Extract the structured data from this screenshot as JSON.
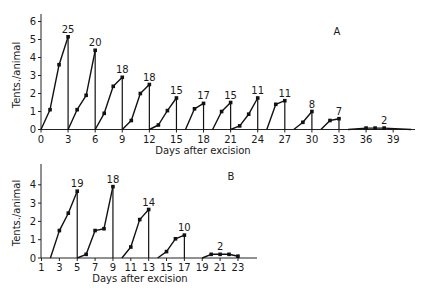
{
  "chart_data": [
    {
      "panel": "A",
      "type": "line",
      "xlabel": "Days after excision",
      "ylabel": "Tents./animal",
      "xlim": [
        0,
        41
      ],
      "ylim": [
        0,
        6
      ],
      "xticks": [
        0,
        3,
        6,
        9,
        12,
        15,
        18,
        21,
        24,
        27,
        30,
        33,
        36,
        39
      ],
      "yticks": [
        0,
        1,
        2,
        3,
        4,
        5,
        6
      ],
      "grid": false,
      "series": [
        {
          "count_label": "25",
          "x": [
            0,
            1,
            2,
            3
          ],
          "y": [
            0,
            1.1,
            3.6,
            5.15
          ]
        },
        {
          "count_label": "20",
          "x": [
            3,
            4,
            5,
            6
          ],
          "y": [
            0,
            1.1,
            1.9,
            4.4
          ]
        },
        {
          "count_label": "18",
          "x": [
            6,
            7,
            8,
            9
          ],
          "y": [
            0,
            0.9,
            2.4,
            2.9
          ]
        },
        {
          "count_label": "18",
          "x": [
            9,
            10,
            11,
            12
          ],
          "y": [
            0,
            0.5,
            2.0,
            2.5
          ]
        },
        {
          "count_label": "15",
          "x": [
            12,
            13,
            14,
            15
          ],
          "y": [
            0,
            0.25,
            1.05,
            1.75
          ]
        },
        {
          "count_label": "17",
          "x": [
            16,
            17,
            18
          ],
          "y": [
            0,
            1.15,
            1.45
          ]
        },
        {
          "count_label": "15",
          "x": [
            19,
            20,
            21
          ],
          "y": [
            0,
            1.0,
            1.5
          ]
        },
        {
          "count_label": "11",
          "x": [
            21,
            22,
            23,
            24
          ],
          "y": [
            0,
            0.2,
            0.85,
            1.75
          ]
        },
        {
          "count_label": "11",
          "x": [
            25,
            26,
            27
          ],
          "y": [
            0,
            1.4,
            1.6
          ]
        },
        {
          "count_label": "8",
          "x": [
            28,
            29,
            30
          ],
          "y": [
            0,
            0.4,
            1.0
          ]
        },
        {
          "count_label": "7",
          "x": [
            31,
            32,
            33
          ],
          "y": [
            0,
            0.5,
            0.6
          ]
        },
        {
          "count_label": "2",
          "x": [
            34,
            36,
            37,
            38,
            41
          ],
          "y": [
            0,
            0.08,
            0.08,
            0.08,
            0
          ],
          "flat": true
        }
      ]
    },
    {
      "panel": "B",
      "type": "line",
      "xlabel": "Days after excision",
      "ylabel": "Tents./animal",
      "xlim": [
        1,
        25
      ],
      "ylim": [
        0,
        4.5
      ],
      "xticks": [
        1,
        3,
        5,
        7,
        9,
        11,
        13,
        15,
        17,
        19,
        21,
        23
      ],
      "yticks": [
        0,
        1,
        2,
        3,
        4
      ],
      "grid": false,
      "series": [
        {
          "count_label": "19",
          "x": [
            2,
            3,
            4,
            5
          ],
          "y": [
            0,
            1.5,
            2.45,
            3.65
          ]
        },
        {
          "count_label": "18",
          "x": [
            5,
            6,
            7,
            8,
            9
          ],
          "y": [
            0,
            0.2,
            1.5,
            1.6,
            3.9
          ]
        },
        {
          "count_label": "14",
          "x": [
            10,
            11,
            12,
            13
          ],
          "y": [
            0,
            0.6,
            2.1,
            2.65
          ]
        },
        {
          "count_label": "10",
          "x": [
            14,
            15,
            16,
            17
          ],
          "y": [
            0,
            0.35,
            1.05,
            1.25
          ]
        },
        {
          "count_label": "2",
          "x": [
            19,
            20,
            21,
            22,
            23
          ],
          "y": [
            0,
            0.2,
            0.2,
            0.2,
            0.1
          ],
          "flat": true
        }
      ]
    }
  ]
}
